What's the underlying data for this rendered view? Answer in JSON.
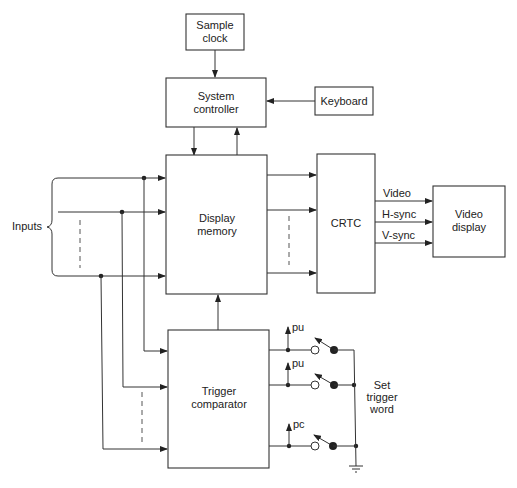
{
  "diagram": {
    "blocks": {
      "sample_clock": [
        "Sample",
        "clock"
      ],
      "system_controller": [
        "System",
        "controller"
      ],
      "keyboard": [
        "Keyboard"
      ],
      "display_memory": [
        "Display",
        "memory"
      ],
      "crtc": [
        "CRTC"
      ],
      "video_display": [
        "Video",
        "display"
      ],
      "trigger_comparator": [
        "Trigger",
        "comparator"
      ]
    },
    "labels": {
      "inputs": "Inputs",
      "video": "Video",
      "hsync": "H-sync",
      "vsync": "V-sync",
      "pullup_1": "pu",
      "pullup_2": "pu",
      "pullup_3": "pc",
      "set_trigger_word": [
        "Set",
        "trigger",
        "word"
      ]
    }
  }
}
